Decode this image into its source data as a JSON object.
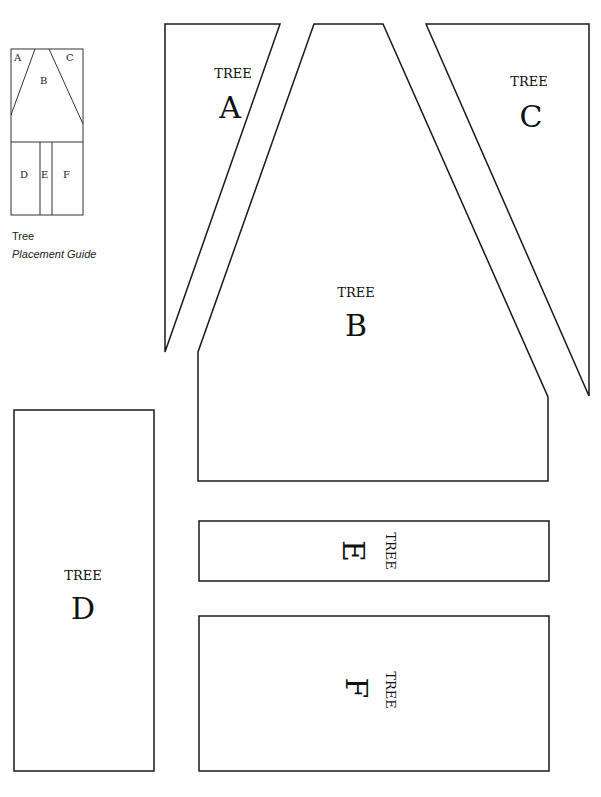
{
  "guide": {
    "title": "Tree",
    "subtitle": "Placement Guide",
    "labels": {
      "a": "A",
      "b": "B",
      "c": "C",
      "d": "D",
      "e": "E",
      "f": "F"
    }
  },
  "pieces": {
    "a": {
      "word": "TREE",
      "letter": "A"
    },
    "b": {
      "word": "TREE",
      "letter": "B"
    },
    "c": {
      "word": "TREE",
      "letter": "C"
    },
    "d": {
      "word": "TREE",
      "letter": "D"
    },
    "e": {
      "word": "TREE",
      "letter": "E"
    },
    "f": {
      "word": "TREE",
      "letter": "F"
    }
  },
  "colors": {
    "stroke": "#1a1a1a",
    "background": "#ffffff"
  }
}
